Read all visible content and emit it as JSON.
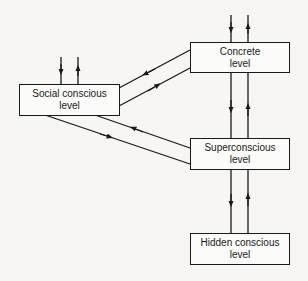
{
  "diagram": {
    "type": "flow",
    "nodes": [
      {
        "id": "concrete",
        "line1": "Concrete",
        "line2": "level"
      },
      {
        "id": "social",
        "line1": "Social conscious",
        "line2": "level"
      },
      {
        "id": "super",
        "line1": "Superconscious",
        "line2": "level"
      },
      {
        "id": "hidden",
        "line1": "Hidden conscious",
        "line2": "level"
      }
    ],
    "edges": [
      {
        "from": "external",
        "to": "concrete"
      },
      {
        "from": "concrete",
        "to": "external"
      },
      {
        "from": "external",
        "to": "social"
      },
      {
        "from": "social",
        "to": "external"
      },
      {
        "from": "concrete",
        "to": "social"
      },
      {
        "from": "social",
        "to": "concrete"
      },
      {
        "from": "super",
        "to": "social"
      },
      {
        "from": "social",
        "to": "super"
      },
      {
        "from": "concrete",
        "to": "super"
      },
      {
        "from": "super",
        "to": "concrete"
      },
      {
        "from": "super",
        "to": "hidden"
      },
      {
        "from": "hidden",
        "to": "super"
      }
    ],
    "colors": {
      "line": "#1a1a1a",
      "background": "#f7f6f3"
    }
  }
}
